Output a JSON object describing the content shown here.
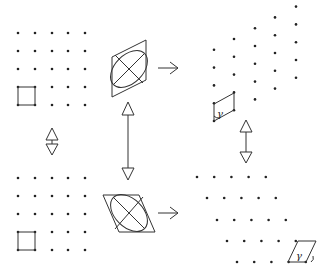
{
  "diagram": {
    "colors": {
      "stroke": "#333333",
      "dot": "#222222",
      "background": "#ffffff"
    },
    "labels": {
      "angle_top": "γ",
      "angle_bottom": "γ"
    },
    "panels": [
      {
        "id": "top-left",
        "kind": "square-lattice"
      },
      {
        "id": "top-center",
        "kind": "ellipse-in-vertical-parallelogram"
      },
      {
        "id": "top-right",
        "kind": "vertically-sheared-lattice"
      },
      {
        "id": "bottom-left",
        "kind": "square-lattice"
      },
      {
        "id": "bottom-center",
        "kind": "ellipse-in-horizontal-parallelogram"
      },
      {
        "id": "bottom-right",
        "kind": "horizontally-sheared-lattice"
      }
    ]
  }
}
